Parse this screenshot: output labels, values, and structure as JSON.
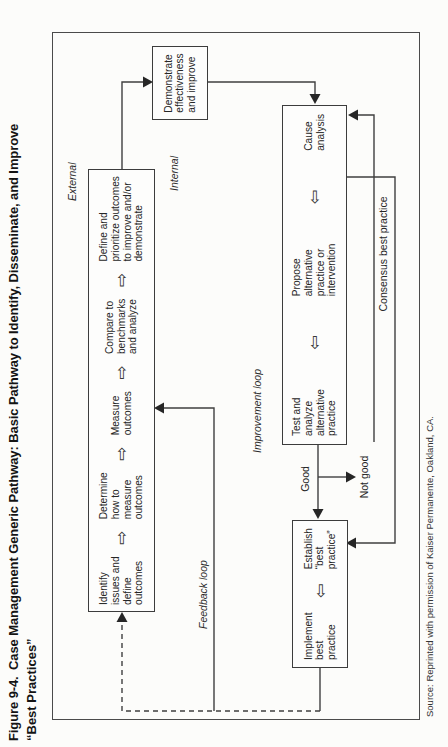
{
  "title": {
    "line1": "Figure 9-4. Case Management Generic Pathway: Basic Pathway to Identify, Disseminate, and Improve",
    "line2": "“Best Practices”"
  },
  "flow": {
    "measurement": {
      "items": [
        "Identify\nissues and\ndefine\noutcomes",
        "Determine\nhow to\nmeasure\noutcomes",
        "Measure\noutcomes",
        "Compare to\nbenchmarks\nand analyze",
        "Define and\nprioritize outcomes\nto improve and/or\ndemonstrate"
      ]
    },
    "demonstrate": "Demonstrate\neffectiveness\nand improve",
    "improvement": {
      "items": [
        "Test and\nanalyze\nalternative\npractice",
        "Propose\nalternative\npractice or\nintervention",
        "Cause\nanalysis"
      ]
    },
    "best_practice": {
      "items": [
        "Implement\nbest\npractice",
        "Establish\n“best\npractice”"
      ]
    }
  },
  "labels": {
    "external": "External",
    "internal": "Internal",
    "feedback_loop": "Feedback loop",
    "improvement_loop": "Improvement loop",
    "good": "Good",
    "not_good": "Not good",
    "consensus": "Consensus best practice"
  },
  "icons": {
    "arrow_right": "⇨",
    "arrow_left": "⇦"
  },
  "source": "Source: Reprinted with permission of Kaiser Permanente, Oakland, CA.",
  "colors": {
    "ink": "#262626",
    "line": "#3f3f3f",
    "paper": "#fcfcfa"
  }
}
